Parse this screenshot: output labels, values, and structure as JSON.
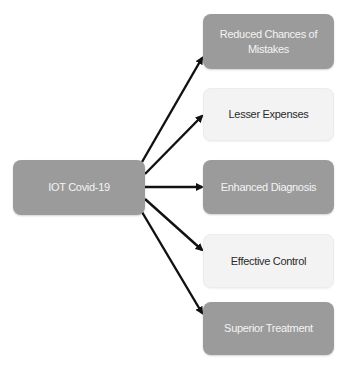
{
  "diagram": {
    "source": {
      "label": "IOT Covid-19",
      "style": "dark"
    },
    "targets": [
      {
        "label": "Reduced Chances of Mistakes",
        "style": "dark"
      },
      {
        "label": "Lesser Expenses",
        "style": "light"
      },
      {
        "label": "Enhanced Diagnosis",
        "style": "dark"
      },
      {
        "label": "Effective Control",
        "style": "light"
      },
      {
        "label": "Superior Treatment",
        "style": "dark"
      }
    ],
    "edges": [
      {
        "from": "IOT Covid-19",
        "to": "Reduced Chances of Mistakes"
      },
      {
        "from": "IOT Covid-19",
        "to": "Lesser Expenses"
      },
      {
        "from": "IOT Covid-19",
        "to": "Enhanced Diagnosis"
      },
      {
        "from": "IOT Covid-19",
        "to": "Effective Control"
      },
      {
        "from": "IOT Covid-19",
        "to": "Superior Treatment"
      }
    ],
    "colors": {
      "dark_fill": "#9b9b9b",
      "dark_text": "#f4f4f4",
      "light_fill": "#f3f3f3",
      "light_text": "#2a2a2a",
      "arrow": "#111111"
    }
  }
}
